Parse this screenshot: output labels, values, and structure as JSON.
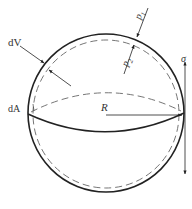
{
  "diagram": {
    "type": "thin-walled spherical shell stress diagram",
    "labels": {
      "dV": "dV",
      "dA": "dA",
      "R": "R",
      "p1": "p",
      "p1_sub": "1",
      "p2": "p",
      "p2_sub": "2",
      "sigma": "σ"
    },
    "colors": {
      "stroke": "#222222",
      "dashed": "#555555",
      "text": "#333333",
      "background": "#ffffff"
    }
  }
}
